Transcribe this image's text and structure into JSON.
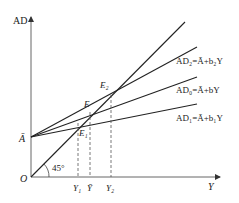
{
  "diagram": {
    "axes": {
      "y_label": "AD",
      "x_label": "Y",
      "origin_label": "O"
    },
    "intercept_label": "Ā",
    "angle_label": "45°",
    "lines": [
      {
        "id": "ad2",
        "label": "AD₂=Ā+b₂Y"
      },
      {
        "id": "ad0",
        "label": "AD₀=Ā+bY"
      },
      {
        "id": "ad1",
        "label": "AD₁=Ā+b₁Y"
      }
    ],
    "points": [
      {
        "id": "E2",
        "label": "E₂"
      },
      {
        "id": "E",
        "label": "E"
      },
      {
        "id": "E1",
        "label": "E₁"
      }
    ],
    "x_ticks": [
      {
        "id": "Y1",
        "label": "Y₁"
      },
      {
        "id": "Ybar",
        "label": "Ȳ"
      },
      {
        "id": "Y2",
        "label": "Y₂"
      }
    ]
  }
}
